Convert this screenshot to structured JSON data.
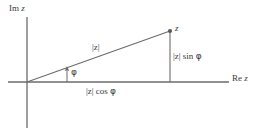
{
  "figure": {
    "background": "#ffffff",
    "stroke_color": "#6b6b6b",
    "text_color": "#3a3a3a",
    "width": 271,
    "height": 133
  },
  "axes": {
    "imaginary": {
      "label_upright": "Im",
      "label_italic": "z",
      "full_label": "Im z"
    },
    "real": {
      "label_upright": "Re",
      "label_italic": "z",
      "full_label": "Re z"
    }
  },
  "labels": {
    "point": "z",
    "modulus": "|z|",
    "angle": "φ",
    "horizontal_leg_mod": "|z|",
    "horizontal_leg_fn": "cos",
    "horizontal_leg_angle": "φ",
    "horizontal_leg": "|z| cos φ",
    "vertical_leg_mod": "|z|",
    "vertical_leg_fn": "sin",
    "vertical_leg_angle": "φ",
    "vertical_leg": "|z| sin φ"
  },
  "geometry": {
    "origin_x": 27,
    "origin_y": 82,
    "point_x": 170,
    "point_y": 31,
    "im_axis_top": 17,
    "im_axis_bottom": 128,
    "re_axis_right": 229,
    "re_axis_left": 8,
    "angle_marker_x": 67,
    "angle_marker_top": 68
  }
}
